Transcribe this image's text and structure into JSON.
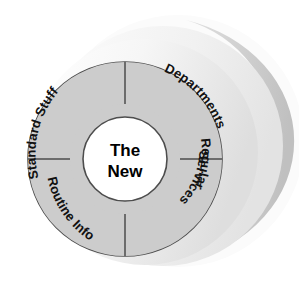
{
  "diagram": {
    "type": "donut-quadrant-wheel",
    "title": "The New",
    "center": {
      "line1": "The",
      "line2": "New",
      "fill_color": "#ffffff",
      "text_color": "#000000"
    },
    "style": {
      "sector_fill": "#cccccc",
      "sector_stroke": "#4d4d4d",
      "depth_band_light": "#f2f2f2",
      "depth_band_mid": "#e4e4e4",
      "depth_band_dark": "#c7c7c7",
      "background": "#ffffff"
    },
    "sectors": [
      {
        "id": "standard-stuff",
        "label": "Standard Stuff",
        "position": "top-left",
        "lines": [
          "Standard Stuff"
        ]
      },
      {
        "id": "departments",
        "label": "Departments",
        "position": "top-right",
        "lines": [
          "Departments"
        ]
      },
      {
        "id": "routine-info",
        "label": "Routine Info",
        "position": "bottom-left",
        "lines": [
          "Routine Info"
        ]
      },
      {
        "id": "regular-services",
        "label": "Regular Services",
        "position": "bottom-right",
        "lines": [
          "Regular",
          "Services"
        ]
      }
    ]
  }
}
